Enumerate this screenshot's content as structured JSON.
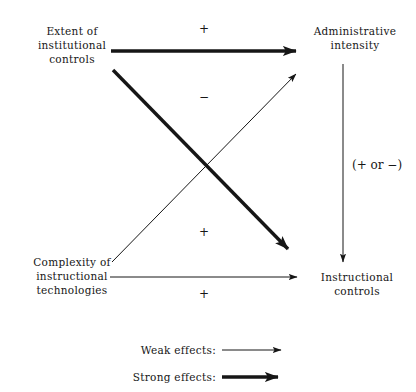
{
  "diagram": {
    "colors": {
      "ink": "#161616",
      "background": "#ffffff"
    },
    "nodes": [
      {
        "id": "extent-institutional-controls",
        "lines": [
          "Extent of",
          "institutional",
          "controls"
        ]
      },
      {
        "id": "administrative-intensity",
        "lines": [
          "Administrative",
          "intensity"
        ]
      },
      {
        "id": "complexity-instructional-technologies",
        "lines": [
          "Complexity of",
          "instructional",
          "technologies"
        ]
      },
      {
        "id": "instructional-controls",
        "lines": [
          "Instructional",
          "controls"
        ]
      }
    ],
    "signs": {
      "top_horizontal": "+",
      "descending_diagonal": "−",
      "ascending_diagonal": "+",
      "bottom_horizontal": "+",
      "vertical": "(+ or −)"
    },
    "edges": [
      {
        "id": "extent-to-administrative",
        "from": "extent-institutional-controls",
        "to": "administrative-intensity",
        "strength": "strong",
        "sign": "+"
      },
      {
        "id": "extent-to-instructional",
        "from": "extent-institutional-controls",
        "to": "instructional-controls",
        "strength": "strong",
        "sign": "−"
      },
      {
        "id": "complexity-to-administrative",
        "from": "complexity-instructional-technologies",
        "to": "administrative-intensity",
        "strength": "weak",
        "sign": "+"
      },
      {
        "id": "complexity-to-instructional",
        "from": "complexity-instructional-technologies",
        "to": "instructional-controls",
        "strength": "weak",
        "sign": "+"
      },
      {
        "id": "administrative-to-instructional",
        "from": "administrative-intensity",
        "to": "instructional-controls",
        "strength": "weak",
        "sign": "(+ or −)"
      }
    ],
    "legend": {
      "weak_label": "Weak effects:",
      "strong_label": "Strong effects:"
    }
  }
}
